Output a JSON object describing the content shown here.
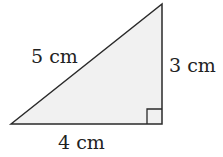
{
  "diagram": {
    "type": "right-triangle",
    "fill_color": "#f1f1f1",
    "stroke_color": "#2a2a2a",
    "sides": {
      "hypotenuse": "5 cm",
      "vertical": "3 cm",
      "base": "4 cm"
    },
    "right_angle_marker": "bottom-right"
  }
}
